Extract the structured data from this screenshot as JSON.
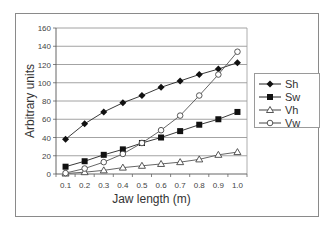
{
  "chart_data": {
    "type": "line",
    "title": "",
    "xlabel": "Jaw length (m)",
    "ylabel": "Arbitrary units",
    "x": [
      0.1,
      0.2,
      0.3,
      0.4,
      0.5,
      0.6,
      0.7,
      0.8,
      0.9,
      1.0
    ],
    "x_tick_labels": [
      "0.1",
      "0.2",
      "0.3",
      "0.4",
      "0.5",
      "0.6",
      "0.7",
      "0.8",
      "0.9",
      "1.0"
    ],
    "y_ticks": [
      0,
      20,
      40,
      60,
      80,
      100,
      120,
      140,
      160
    ],
    "ylim": [
      0,
      160
    ],
    "grid": "horizontal",
    "legend_position": "right",
    "series": [
      {
        "name": "Sh",
        "marker": "filled-diamond",
        "values": [
          38,
          55,
          68,
          78,
          86,
          95,
          102,
          109,
          115,
          122
        ]
      },
      {
        "name": "Sw",
        "marker": "filled-square",
        "values": [
          8,
          14,
          21,
          27,
          34,
          40,
          47,
          54,
          60,
          68
        ]
      },
      {
        "name": "Vh",
        "marker": "open-triangle",
        "values": [
          0.5,
          2,
          4,
          7,
          9,
          11,
          13,
          16,
          21,
          24
        ]
      },
      {
        "name": "Vw",
        "marker": "open-circle",
        "values": [
          1,
          6,
          13,
          22,
          34,
          48,
          64,
          86,
          109,
          134
        ]
      }
    ]
  },
  "legend": {
    "items": [
      "Sh",
      "Sw",
      "Vh",
      "Vw"
    ]
  }
}
